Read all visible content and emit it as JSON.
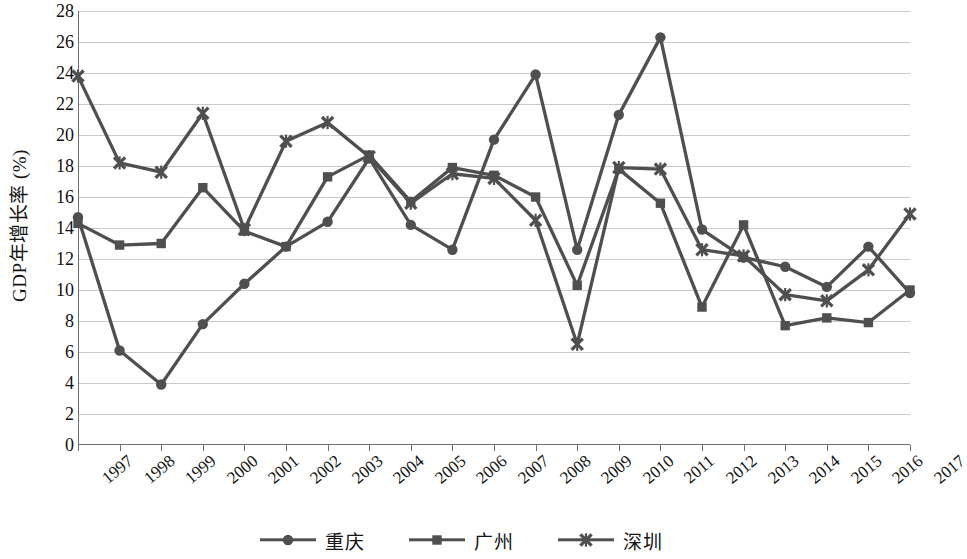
{
  "chart_data": {
    "type": "line",
    "title": "",
    "xlabel": "",
    "ylabel": "GDP年增长率 (%)",
    "ylim": [
      0,
      28
    ],
    "ytick_step": 2,
    "yticks": [
      28,
      26,
      24,
      22,
      20,
      18,
      16,
      14,
      12,
      10,
      8,
      6,
      4,
      2,
      0
    ],
    "grid": true,
    "legend_position": "bottom",
    "categories": [
      "1997",
      "1998",
      "1999",
      "2000",
      "2001",
      "2002",
      "2003",
      "2004",
      "2005",
      "2006",
      "2007",
      "2008",
      "2009",
      "2010",
      "2011",
      "2012",
      "2013",
      "2014",
      "2015",
      "2016",
      "2017"
    ],
    "x": [
      "1997",
      "1998",
      "1999",
      "2000",
      "2001",
      "2002",
      "2003",
      "2004",
      "2005",
      "2006",
      "2007",
      "2008",
      "2009",
      "2010",
      "2011",
      "2012",
      "2013",
      "2014",
      "2015",
      "2016",
      "2017"
    ],
    "series": [
      {
        "name": "重庆",
        "marker": "circle",
        "color": "#4f4f4f",
        "values": [
          14.7,
          6.1,
          3.9,
          7.8,
          10.4,
          12.8,
          14.4,
          18.5,
          14.2,
          12.6,
          19.7,
          23.9,
          12.6,
          21.3,
          26.3,
          13.9,
          12.1,
          11.5,
          10.2,
          12.8,
          9.8
        ]
      },
      {
        "name": "广州",
        "marker": "square",
        "color": "#4f4f4f",
        "values": [
          14.3,
          12.9,
          13.0,
          16.6,
          13.8,
          12.8,
          17.3,
          18.7,
          15.7,
          17.9,
          17.4,
          16.0,
          10.3,
          17.8,
          15.6,
          8.9,
          14.2,
          7.7,
          8.2,
          7.9,
          10.0
        ]
      },
      {
        "name": "深圳",
        "marker": "x-cross",
        "color": "#4f4f4f",
        "values": [
          23.8,
          18.2,
          17.6,
          21.4,
          13.9,
          19.6,
          20.8,
          18.6,
          15.6,
          17.5,
          17.2,
          14.5,
          6.5,
          17.9,
          17.8,
          12.6,
          12.2,
          9.7,
          9.3,
          11.3,
          14.9
        ]
      }
    ]
  },
  "axis": {
    "y_title": "GDP年增长率 (%)"
  },
  "legend": {
    "items": [
      {
        "label": "重庆",
        "marker": "circle"
      },
      {
        "label": "广州",
        "marker": "square"
      },
      {
        "label": "深圳",
        "marker": "x-cross"
      }
    ]
  },
  "colors": {
    "series_line": "#4f4f4f",
    "gridline": "#c9c9c9",
    "axis": "#6f6f6f",
    "text": "#141414"
  }
}
